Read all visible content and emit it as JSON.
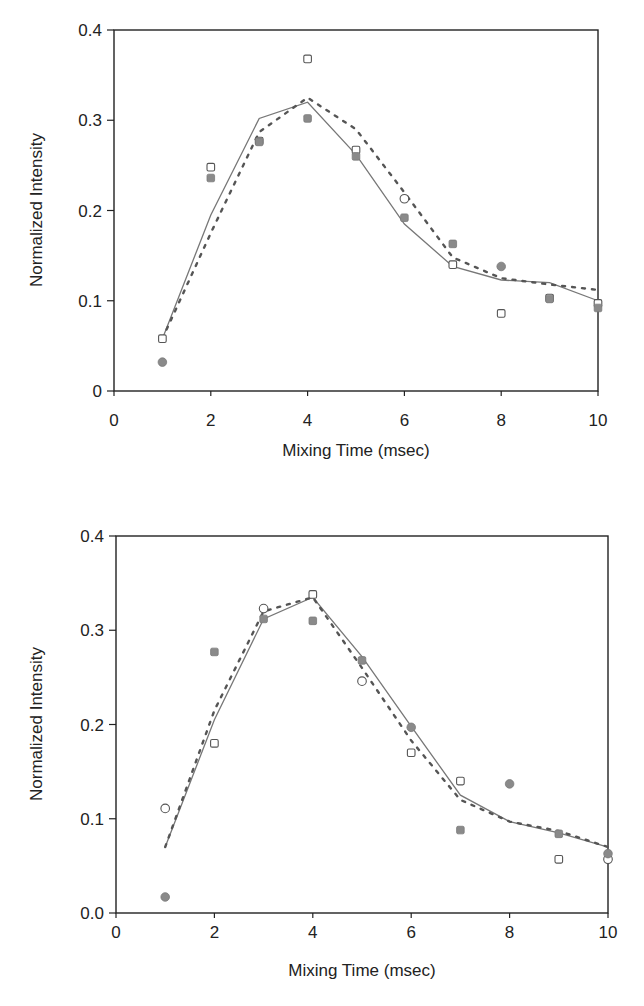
{
  "chart_data": [
    {
      "type": "scatter",
      "title": "",
      "xlabel": "Mixing Time (msec)",
      "ylabel": "Normalized Intensity",
      "xlim": [
        0,
        10
      ],
      "ylim": [
        0,
        0.4
      ],
      "xticks": [
        "0",
        "2",
        "4",
        "6",
        "8",
        "10"
      ],
      "yticks": [
        "0",
        "0.1",
        "0.2",
        "0.3",
        "0.4"
      ],
      "grid": false,
      "legend": "none",
      "x": [
        1,
        2,
        3,
        4,
        5,
        6,
        7,
        8,
        9,
        10
      ],
      "series": [
        {
          "name": "open-markers",
          "style": "open",
          "shapes": [
            "square",
            "square",
            "square",
            "square",
            "square",
            "circle",
            "square",
            "square",
            "square",
            "square"
          ],
          "values": [
            0.058,
            0.248,
            0.277,
            0.368,
            0.267,
            0.213,
            0.14,
            0.086,
            0.103,
            0.097
          ]
        },
        {
          "name": "filled-markers",
          "style": "filled",
          "shapes": [
            "circle",
            "square",
            "square",
            "square",
            "square",
            "square",
            "square",
            "circle",
            "square",
            "square"
          ],
          "values": [
            0.032,
            0.236,
            0.276,
            0.302,
            0.26,
            0.192,
            0.163,
            0.138,
            0.102,
            0.092
          ]
        },
        {
          "name": "fit-solid",
          "style": "solid-line",
          "values": [
            0.058,
            0.195,
            0.302,
            0.32,
            0.262,
            0.185,
            0.138,
            0.123,
            0.12,
            0.1
          ]
        },
        {
          "name": "fit-dashed",
          "style": "dashed-line",
          "values": [
            0.058,
            0.175,
            0.287,
            0.325,
            0.29,
            0.22,
            0.148,
            0.125,
            0.118,
            0.112
          ]
        }
      ]
    },
    {
      "type": "scatter",
      "title": "",
      "xlabel": "Mixing Time (msec)",
      "ylabel": "Normalized Intensity",
      "xlim": [
        0,
        10
      ],
      "ylim": [
        0,
        0.4
      ],
      "xticks": [
        "0",
        "2",
        "4",
        "6",
        "8",
        "10"
      ],
      "yticks": [
        "0.0",
        "0.1",
        "0.2",
        "0.3",
        "0.4"
      ],
      "grid": false,
      "legend": "none",
      "x": [
        1,
        2,
        3,
        4,
        5,
        6,
        7,
        8,
        9,
        10
      ],
      "series": [
        {
          "name": "open-markers",
          "style": "open",
          "shapes": [
            "circle",
            "square",
            "circle",
            "square",
            "circle",
            "square",
            "square",
            null,
            "square",
            "circle"
          ],
          "values": [
            0.111,
            0.18,
            0.323,
            0.338,
            0.246,
            0.17,
            0.14,
            null,
            0.057,
            0.057
          ]
        },
        {
          "name": "filled-markers",
          "style": "filled",
          "shapes": [
            "circle",
            "square",
            "square",
            "square",
            "square",
            "circle",
            "square",
            "circle",
            "square",
            "circle"
          ],
          "values": [
            0.017,
            0.277,
            0.312,
            0.31,
            0.268,
            0.197,
            0.088,
            0.137,
            0.084,
            0.063
          ]
        },
        {
          "name": "fit-solid",
          "style": "solid-line",
          "values": [
            0.07,
            0.205,
            0.312,
            0.335,
            0.272,
            0.198,
            0.125,
            0.097,
            0.085,
            0.07
          ]
        },
        {
          "name": "fit-dashed",
          "style": "dashed-line",
          "values": [
            0.07,
            0.215,
            0.32,
            0.335,
            0.26,
            0.183,
            0.12,
            0.097,
            0.087,
            0.07
          ]
        }
      ]
    }
  ]
}
